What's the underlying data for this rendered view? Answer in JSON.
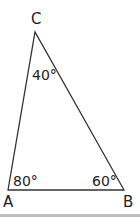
{
  "diagram": {
    "type": "triangle",
    "vertices": [
      {
        "label": "A",
        "x": 8,
        "y": 190
      },
      {
        "label": "B",
        "x": 124,
        "y": 190
      },
      {
        "label": "C",
        "x": 35,
        "y": 32
      }
    ],
    "angles": {
      "A": "80°",
      "B": "60°",
      "C": "40°"
    },
    "stroke_color": "#333333",
    "rule_color": "#bfbfbf"
  }
}
